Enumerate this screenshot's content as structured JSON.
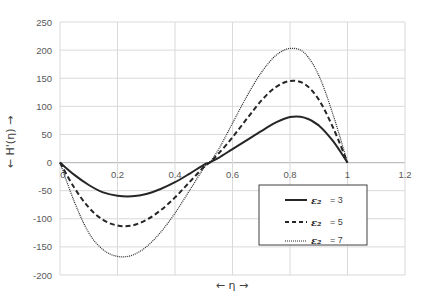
{
  "chart_data": {
    "type": "line",
    "title": "",
    "xlabel": "← η →",
    "ylabel": "← H'(η) →",
    "xlim": [
      0,
      1.2
    ],
    "ylim": [
      -200,
      250
    ],
    "x_ticks": [
      0,
      0.2,
      0.4,
      0.6,
      0.8,
      1,
      1.2
    ],
    "x_tick_labels": [
      "0",
      "0.2",
      "0.4",
      "0.6",
      "0.8",
      "1",
      "1.2"
    ],
    "y_ticks": [
      250,
      200,
      150,
      100,
      50,
      0,
      -50,
      -100,
      -150,
      -200
    ],
    "y_tick_labels": [
      "250",
      "200",
      "150",
      "100",
      "50",
      "0",
      "-50",
      "-100",
      "-150",
      "-200"
    ],
    "grid": true,
    "legend_position": "lower right (inside plot)",
    "x": [
      0,
      0.05,
      0.1,
      0.15,
      0.2,
      0.25,
      0.3,
      0.35,
      0.4,
      0.45,
      0.5,
      0.52,
      0.55,
      0.6,
      0.65,
      0.7,
      0.75,
      0.8,
      0.85,
      0.9,
      0.95,
      1.0
    ],
    "series": [
      {
        "name": "ε₂ = 3",
        "style": "solid",
        "values": [
          0,
          -22,
          -40,
          -53,
          -59,
          -60,
          -56,
          -47,
          -35,
          -20,
          -4,
          0,
          8,
          24,
          40,
          56,
          71,
          81,
          80,
          66,
          38,
          0
        ]
      },
      {
        "name": "ε₂ = 5",
        "style": "dashed",
        "values": [
          0,
          -45,
          -80,
          -102,
          -112,
          -112,
          -102,
          -85,
          -62,
          -35,
          -8,
          0,
          15,
          45,
          78,
          110,
          134,
          145,
          140,
          112,
          62,
          0
        ]
      },
      {
        "name": "ε₂ = 7",
        "style": "dotted",
        "values": [
          0,
          -70,
          -125,
          -155,
          -167,
          -165,
          -150,
          -124,
          -90,
          -50,
          -10,
          0,
          22,
          70,
          118,
          160,
          190,
          203,
          195,
          155,
          85,
          0
        ]
      }
    ]
  },
  "legend": {
    "items": [
      {
        "symbol": "ε₂",
        "value": "= 3",
        "style": "solid"
      },
      {
        "symbol": "ε₂",
        "value": "= 5",
        "style": "dashed"
      },
      {
        "symbol": "ε₂",
        "value": "= 7",
        "style": "dotted"
      }
    ]
  },
  "colors": {
    "line": "#262626",
    "grid": "#d9d9d9",
    "axis": "#bfbfbf",
    "text": "#595959"
  }
}
